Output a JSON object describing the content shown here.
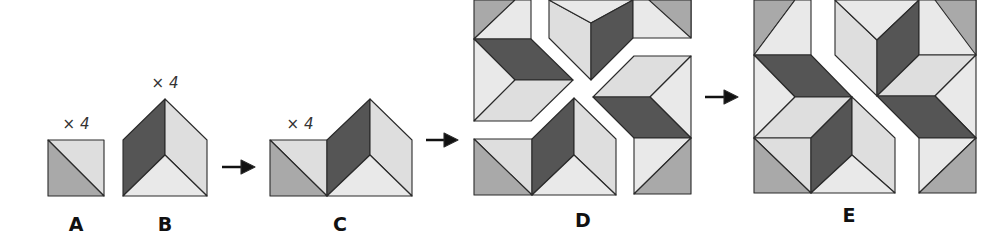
{
  "figure": {
    "colors": {
      "dark": "#555555",
      "medium": "#a9a9a9",
      "light": "#dedede",
      "lighter": "#e9e9e9",
      "outline": "#2a2a2a",
      "arrow": "#111111"
    },
    "labels": [
      {
        "id": "A",
        "text": "A",
        "x": 76,
        "y": 215
      },
      {
        "id": "B",
        "text": "B",
        "x": 165,
        "y": 215
      },
      {
        "id": "C",
        "text": "C",
        "x": 340,
        "y": 215
      },
      {
        "id": "D",
        "text": "D",
        "x": 583,
        "y": 211
      },
      {
        "id": "E",
        "text": "E",
        "x": 849,
        "y": 206
      }
    ],
    "multipliers": [
      {
        "for": "A",
        "text": "× 4",
        "x": 76,
        "y": 117
      },
      {
        "for": "B",
        "text": "× 4",
        "x": 165,
        "y": 76
      },
      {
        "for": "C",
        "text": "× 4",
        "x": 300,
        "y": 117
      }
    ],
    "arrows": [
      {
        "from": "B",
        "to": "C",
        "x1": 222,
        "x2": 255,
        "y": 167
      },
      {
        "from": "C",
        "to": "D",
        "x1": 426,
        "x2": 458,
        "y": 140
      },
      {
        "from": "D",
        "to": "E",
        "x1": 705,
        "x2": 738,
        "y": 97
      }
    ],
    "shapes": [
      {
        "group": "A",
        "fill": "light",
        "points": "48,140 104,140 104,196"
      },
      {
        "group": "A",
        "fill": "medium",
        "points": "48,140 104,196 48,196"
      },
      {
        "group": "B",
        "fill": "dark",
        "points": "123,140 165,99 165,155 123,196"
      },
      {
        "group": "B",
        "fill": "light",
        "points": "165,99 207,140 207,196 165,155"
      },
      {
        "group": "B",
        "fill": "lighter",
        "points": "123,196 165,155 207,196"
      },
      {
        "group": "C",
        "fill": "light",
        "points": "270,140 327,140 327,196"
      },
      {
        "group": "C",
        "fill": "medium",
        "points": "270,140 327,196 270,196"
      },
      {
        "group": "C",
        "fill": "dark",
        "points": "327,140 370,99 370,155 327,196"
      },
      {
        "group": "C",
        "fill": "light",
        "points": "370,99 412,140 412,196 370,155"
      },
      {
        "group": "C",
        "fill": "lighter",
        "points": "327,196 370,155 412,196"
      },
      {
        "group": "D",
        "fill": "medium",
        "points": "474,0 515,0 474,39"
      },
      {
        "group": "D",
        "fill": "lighter",
        "points": "515,0 531,0 531,39 474,39"
      },
      {
        "group": "D",
        "fill": "dark",
        "points": "474,39 531,39 573,80 515,80"
      },
      {
        "group": "D",
        "fill": "lighter",
        "points": "474,39 515,80 474,121"
      },
      {
        "group": "D",
        "fill": "light",
        "points": "474,121 515,80 573,80 531,121"
      },
      {
        "group": "D",
        "fill": "light",
        "points": "549,0 591,23 591,80 549,38"
      },
      {
        "group": "D",
        "fill": "lighter",
        "points": "549,0 633,0 591,23"
      },
      {
        "group": "D",
        "fill": "dark",
        "points": "591,23 633,0 633,38 591,80"
      },
      {
        "group": "D",
        "fill": "lighter",
        "points": "633,0 691,0 691,38 633,38"
      },
      {
        "group": "D",
        "fill": "medium",
        "points": "649,0 691,0 691,38"
      },
      {
        "group": "D",
        "fill": "light",
        "points": "634,56 691,56 650,97 593,97"
      },
      {
        "group": "D",
        "fill": "lighter",
        "points": "691,56 691,138 650,97"
      },
      {
        "group": "D",
        "fill": "dark",
        "points": "593,97 650,97 691,138 634,138"
      },
      {
        "group": "D",
        "fill": "lighter",
        "points": "634,138 691,138 634,194"
      },
      {
        "group": "D",
        "fill": "medium",
        "points": "691,138 691,194 634,194"
      },
      {
        "group": "D",
        "fill": "light",
        "points": "474,139 532,139 532,195"
      },
      {
        "group": "D",
        "fill": "medium",
        "points": "474,139 532,195 474,195"
      },
      {
        "group": "D",
        "fill": "dark",
        "points": "532,139 574,98 574,155 532,195"
      },
      {
        "group": "D",
        "fill": "light",
        "points": "574,98 616,139 616,195 574,155"
      },
      {
        "group": "D",
        "fill": "lighter",
        "points": "532,195 574,155 616,195"
      },
      {
        "group": "E",
        "fill": "medium",
        "points": "754,0 795,0 754,55"
      },
      {
        "group": "E",
        "fill": "lighter",
        "points": "795,0 811,0 811,55 754,55"
      },
      {
        "group": "E",
        "fill": "dark",
        "points": "754,55 811,55 852,97 795,97"
      },
      {
        "group": "E",
        "fill": "lighter",
        "points": "754,55 795,97 754,138"
      },
      {
        "group": "E",
        "fill": "light",
        "points": "754,138 795,97 852,97 811,138"
      },
      {
        "group": "E",
        "fill": "light",
        "points": "754,138 811,138 811,193"
      },
      {
        "group": "E",
        "fill": "medium",
        "points": "754,138 811,193 754,193"
      },
      {
        "group": "E",
        "fill": "dark",
        "points": "811,138 852,97 852,155 811,193"
      },
      {
        "group": "E",
        "fill": "light",
        "points": "852,97 895,138 895,193 852,155"
      },
      {
        "group": "E",
        "fill": "lighter",
        "points": "811,193 852,155 895,193"
      },
      {
        "group": "E",
        "fill": "light",
        "points": "835,0 877,40 877,96 835,55"
      },
      {
        "group": "E",
        "fill": "lighter",
        "points": "835,0 919,0 877,40"
      },
      {
        "group": "E",
        "fill": "dark",
        "points": "877,40 919,0 919,55 877,96"
      },
      {
        "group": "E",
        "fill": "lighter",
        "points": "919,0 976,0 976,55 919,55"
      },
      {
        "group": "E",
        "fill": "medium",
        "points": "935,0 976,0 976,55"
      },
      {
        "group": "E",
        "fill": "light",
        "points": "919,55 976,55 935,96 877,96"
      },
      {
        "group": "E",
        "fill": "lighter",
        "points": "976,55 976,138 935,96"
      },
      {
        "group": "E",
        "fill": "dark",
        "points": "877,96 935,96 976,138 919,138"
      },
      {
        "group": "E",
        "fill": "lighter",
        "points": "919,138 976,138 919,193"
      },
      {
        "group": "E",
        "fill": "medium",
        "points": "976,138 976,193 919,193"
      }
    ]
  }
}
